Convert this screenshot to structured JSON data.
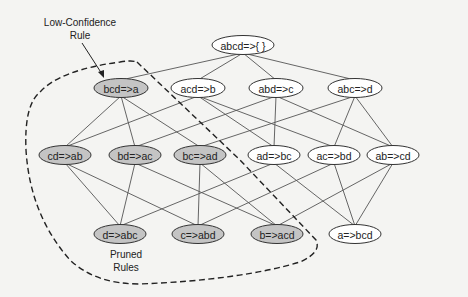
{
  "diagram": {
    "type": "rule-lattice",
    "colors": {
      "pruned_fill": "#c4c4c4",
      "normal_fill": "#ffffff",
      "edge": "#555555",
      "border": "#333333"
    },
    "annotations": {
      "low_confidence_line1": "Low-Confidence",
      "low_confidence_line2": "Rule",
      "pruned_line1": "Pruned",
      "pruned_line2": "Rules"
    },
    "levels": [
      [
        {
          "id": "abcd",
          "label": "abcd=>{ }",
          "pruned": false
        }
      ],
      [
        {
          "id": "bcd",
          "label": "bcd=>a",
          "pruned": true
        },
        {
          "id": "acd",
          "label": "acd=>b",
          "pruned": false
        },
        {
          "id": "abd",
          "label": "abd=>c",
          "pruned": false
        },
        {
          "id": "abc",
          "label": "abc=>d",
          "pruned": false
        }
      ],
      [
        {
          "id": "cd",
          "label": "cd=>ab",
          "pruned": true
        },
        {
          "id": "bd",
          "label": "bd=>ac",
          "pruned": true
        },
        {
          "id": "bc",
          "label": "bc=>ad",
          "pruned": true
        },
        {
          "id": "ad",
          "label": "ad=>bc",
          "pruned": false
        },
        {
          "id": "ac",
          "label": "ac=>bd",
          "pruned": false
        },
        {
          "id": "ab",
          "label": "ab=>cd",
          "pruned": false
        }
      ],
      [
        {
          "id": "d",
          "label": "d=>abc",
          "pruned": true
        },
        {
          "id": "c",
          "label": "c=>abd",
          "pruned": true
        },
        {
          "id": "b",
          "label": "b=>acd",
          "pruned": true
        },
        {
          "id": "a",
          "label": "a=>bcd",
          "pruned": false
        }
      ]
    ],
    "edges": [
      [
        "abcd",
        "bcd"
      ],
      [
        "abcd",
        "acd"
      ],
      [
        "abcd",
        "abd"
      ],
      [
        "abcd",
        "abc"
      ],
      [
        "bcd",
        "cd"
      ],
      [
        "bcd",
        "bd"
      ],
      [
        "bcd",
        "bc"
      ],
      [
        "acd",
        "cd"
      ],
      [
        "acd",
        "ad"
      ],
      [
        "acd",
        "ac"
      ],
      [
        "abd",
        "bd"
      ],
      [
        "abd",
        "ad"
      ],
      [
        "abd",
        "ab"
      ],
      [
        "abc",
        "bc"
      ],
      [
        "abc",
        "ac"
      ],
      [
        "abc",
        "ab"
      ],
      [
        "cd",
        "d"
      ],
      [
        "cd",
        "c"
      ],
      [
        "bd",
        "d"
      ],
      [
        "bd",
        "b"
      ],
      [
        "bc",
        "c"
      ],
      [
        "bc",
        "b"
      ],
      [
        "ad",
        "d"
      ],
      [
        "ad",
        "a"
      ],
      [
        "ac",
        "c"
      ],
      [
        "ac",
        "a"
      ],
      [
        "ab",
        "b"
      ],
      [
        "ab",
        "a"
      ]
    ]
  }
}
